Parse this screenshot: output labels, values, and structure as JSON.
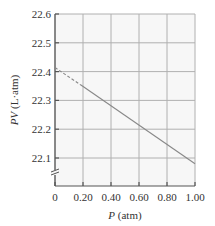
{
  "chart_data": {
    "type": "line",
    "title": "",
    "xlabel": "P (atm)",
    "xlabel_var": "P",
    "xlabel_unit": "(atm)",
    "ylabel": "PV (L-atm)",
    "ylabel_var": "PV",
    "ylabel_unit": "(L·atm)",
    "xlim": [
      0,
      1.0
    ],
    "ylim": [
      22.0,
      22.6
    ],
    "grid": true,
    "y_axis_break": true,
    "x_ticks": [
      "0",
      "0.20",
      "0.40",
      "0.60",
      "0.80",
      "1.00"
    ],
    "y_ticks": [
      "22.1",
      "22.2",
      "22.3",
      "22.4",
      "22.5",
      "22.6"
    ],
    "series": [
      {
        "name": "measured (solid)",
        "style": "solid",
        "x": [
          0.18,
          1.0
        ],
        "y": [
          22.355,
          22.08
        ]
      },
      {
        "name": "extrapolation (dashed)",
        "style": "dashed",
        "x": [
          0.0,
          0.18
        ],
        "y": [
          22.414,
          22.355
        ]
      }
    ],
    "annotations": [
      "Extrapolated intercept at P = 0 ≈ 22.41 L·atm"
    ]
  },
  "colors": {
    "plot_bg": "#f7f7f7",
    "grid": "#b0b0b0",
    "frame": "#555555",
    "line": "#888888",
    "text": "#333333"
  }
}
